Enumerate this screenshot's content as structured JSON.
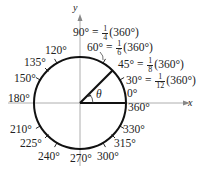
{
  "axes": {
    "x_label": "x",
    "y_label": "y"
  },
  "theta_label": "θ",
  "angles": {
    "a0": "0°",
    "a360": "360°",
    "a30": "30°",
    "a45": "45°",
    "a60": "60°",
    "a90": "90°",
    "a120": "120°",
    "a135": "135°",
    "a150": "150°",
    "a180": "180°",
    "a210": "210°",
    "a225": "225°",
    "a240": "240°",
    "a270": "270°",
    "a300": "300°",
    "a315": "315°",
    "a330": "330°"
  },
  "fractions": {
    "f90": {
      "num": "1",
      "den": "4",
      "tail": "(360°)"
    },
    "f60": {
      "num": "1",
      "den": "6",
      "tail": "(360°)"
    },
    "f45": {
      "num": "1",
      "den": "8",
      "tail": "(360°)"
    },
    "f30": {
      "num": "1",
      "den": "12",
      "tail": "(360°)"
    }
  },
  "equals": "="
}
